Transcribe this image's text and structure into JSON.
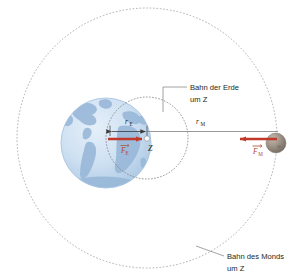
{
  "figure": {
    "width": 294,
    "height": 276,
    "background": "#ffffff"
  },
  "colors": {
    "earth_ocean": "#cfe1f2",
    "earth_land": "#9ab8d8",
    "earth_edge": "#a8c4e0",
    "moon_body": "#8d8277",
    "moon_highlight": "#b8ada0",
    "force_arrow": "#c0392b",
    "force_label": "#b04a2a",
    "orbit_line": "#8c8c8c",
    "dim_line": "#6e6e6e",
    "leader_line": "#8c8c8c",
    "text": "#231f20"
  },
  "bodies": {
    "earth": {
      "name": "Erde",
      "cx": 106,
      "cy": 143,
      "r": 45
    },
    "moon": {
      "name": "Mond",
      "cx": 276,
      "cy": 143,
      "r": 10
    },
    "barycenter": {
      "label": "Z",
      "name": "Schwerpunkt Z",
      "cx": 147,
      "cy": 138
    }
  },
  "orbits": {
    "earth_orbit": {
      "label_line1": "Bahn der Erde",
      "label_line2": "um Z",
      "cx": 147,
      "cy": 138,
      "r": 41,
      "style": "dotted"
    },
    "moon_orbit": {
      "label_line1": "Bahn des Monds",
      "label_line2": "um Z",
      "cx": 147,
      "cy": 138,
      "r": 130,
      "style": "dotted"
    }
  },
  "labels": {
    "r_earth": {
      "symbol": "r",
      "subscript": "E",
      "name": "Abstand Erde zu Z"
    },
    "r_moon": {
      "symbol": "r",
      "subscript": "M",
      "name": "Abstand Mond zu Z"
    },
    "f_earth": {
      "symbol": "F",
      "subscript": "E",
      "name": "Kraft auf die Erde"
    },
    "f_moon": {
      "symbol": "F",
      "subscript": "M",
      "name": "Kraft auf den Mond"
    }
  }
}
